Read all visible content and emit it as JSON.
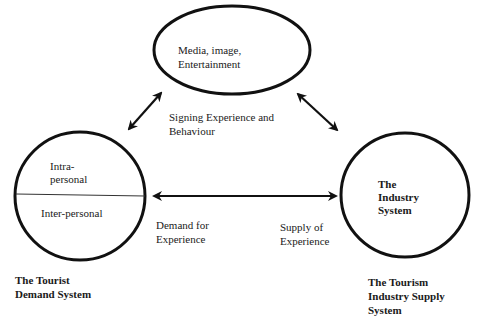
{
  "diagram": {
    "nodes": {
      "media": {
        "label_line1": "Media, image,",
        "label_line2": "Entertainment"
      },
      "demand": {
        "upper_line1": "Intra-",
        "upper_line2": "personal",
        "lower": "Inter-personal",
        "caption_line1": "The Tourist",
        "caption_line2": "Demand System"
      },
      "industry": {
        "label_line1": "The",
        "label_line2": "Industry",
        "label_line3": "System",
        "caption_line1": "The Tourism",
        "caption_line2": "Industry Supply",
        "caption_line3": "System"
      }
    },
    "edges": {
      "signing": {
        "line1": "Signing Experience and",
        "line2": "Behaviour"
      },
      "demand_for": {
        "line1": "Demand for",
        "line2": "Experience"
      },
      "supply_of": {
        "line1": "Supply of",
        "line2": "Experience"
      }
    },
    "colors": {
      "stroke": "#111111",
      "background": "#ffffff"
    }
  }
}
